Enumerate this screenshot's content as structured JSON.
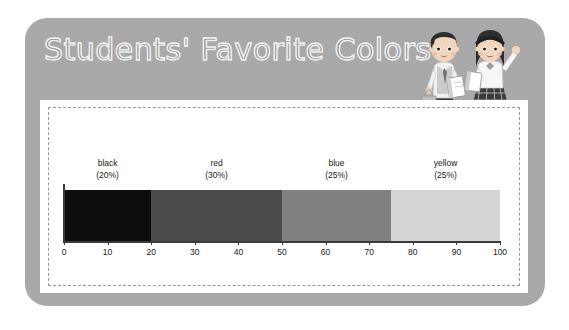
{
  "poster": {
    "title": "Students' Favorite Colors",
    "card_color": "#a9a9a9",
    "panel_color": "#ffffff",
    "dash_border_color": "#9a9a9a",
    "title_outline_color": "#f2f2f2"
  },
  "illustration": {
    "name": "two-students-illustration",
    "boy": "schoolboy-with-book-and-bag",
    "girl": "schoolgirl-waving-with-book"
  },
  "chart_data": {
    "type": "bar",
    "orientation": "horizontal-stacked",
    "title": "Students' Favorite Colors",
    "xlabel": "",
    "ylabel": "",
    "xlim": [
      0,
      100
    ],
    "grid": false,
    "legend": "none",
    "categories": [
      "black",
      "red",
      "blue",
      "yellow"
    ],
    "values": [
      20,
      30,
      25,
      25
    ],
    "labels": [
      {
        "name": "black",
        "percent": "(20%)",
        "value": 20,
        "color": "#0d0d0d",
        "start": 0,
        "end": 20
      },
      {
        "name": "red",
        "percent": "(30%)",
        "value": 30,
        "color": "#4a4a4a",
        "start": 20,
        "end": 50
      },
      {
        "name": "blue",
        "percent": "(25%)",
        "value": 25,
        "color": "#808080",
        "start": 50,
        "end": 75
      },
      {
        "name": "yellow",
        "percent": "(25%)",
        "value": 25,
        "color": "#d5d5d5",
        "start": 75,
        "end": 100
      }
    ],
    "xticks": [
      0,
      10,
      20,
      30,
      40,
      50,
      60,
      70,
      80,
      90,
      100
    ],
    "xticklabels": [
      "0",
      "10",
      "20",
      "30",
      "40",
      "50",
      "60",
      "70",
      "80",
      "90",
      "100"
    ],
    "axis_color": "#3a3a3a"
  }
}
